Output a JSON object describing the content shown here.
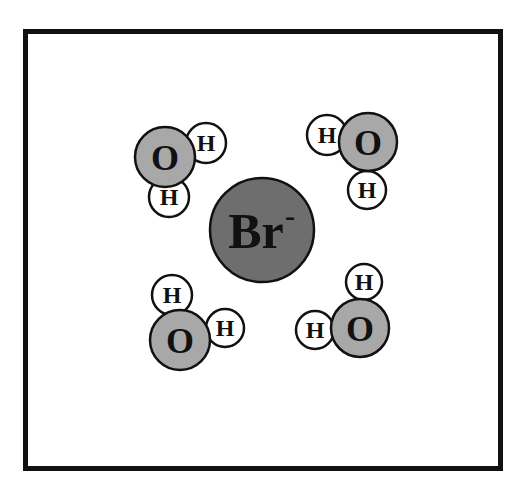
{
  "diagram": {
    "ion": {
      "label": "Br",
      "charge": "-",
      "cx": 262,
      "cy": 230,
      "r": 52,
      "fill": "#6e6e6e"
    },
    "colors": {
      "oxygen": "#a8a8a8",
      "hydrogen": "#ffffff",
      "stroke": "#111111"
    },
    "waters": [
      {
        "name": "top-left",
        "O": {
          "label": "O",
          "cx": 165,
          "cy": 157,
          "r": 30
        },
        "H": [
          {
            "label": "H",
            "cx": 206,
            "cy": 143,
            "r": 20
          },
          {
            "label": "H",
            "cx": 169,
            "cy": 197,
            "r": 20
          }
        ]
      },
      {
        "name": "top-right",
        "O": {
          "label": "O",
          "cx": 368,
          "cy": 142,
          "r": 29
        },
        "H": [
          {
            "label": "H",
            "cx": 327,
            "cy": 135,
            "r": 20
          },
          {
            "label": "H",
            "cx": 367,
            "cy": 190,
            "r": 19
          }
        ]
      },
      {
        "name": "bottom-left",
        "O": {
          "label": "O",
          "cx": 180,
          "cy": 340,
          "r": 30
        },
        "H": [
          {
            "label": "H",
            "cx": 172,
            "cy": 295,
            "r": 20
          },
          {
            "label": "H",
            "cx": 225,
            "cy": 328,
            "r": 19
          }
        ]
      },
      {
        "name": "bottom-right",
        "O": {
          "label": "O",
          "cx": 360,
          "cy": 328,
          "r": 29
        },
        "H": [
          {
            "label": "H",
            "cx": 364,
            "cy": 282,
            "r": 18
          },
          {
            "label": "H",
            "cx": 315,
            "cy": 330,
            "r": 19
          }
        ]
      }
    ]
  }
}
